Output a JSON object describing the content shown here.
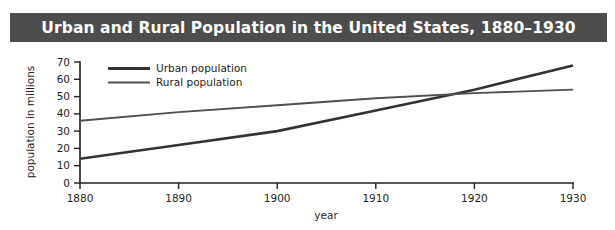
{
  "title": {
    "text": "Urban and Rural Population in the United States, 1880–1930",
    "background_color": "#4d4d4d",
    "text_color": "#ffffff"
  },
  "chart_data": {
    "type": "line",
    "title": "Urban and Rural Population in the United States, 1880–1930",
    "xlabel": "year",
    "ylabel": "population in millions",
    "x": [
      1880,
      1890,
      1900,
      1910,
      1920,
      1930
    ],
    "xlim": [
      1880,
      1930
    ],
    "ylim": [
      0,
      70
    ],
    "xticks": [
      1880,
      1890,
      1900,
      1910,
      1920,
      1930
    ],
    "xtick_labels": [
      "1880",
      "1890",
      "1900",
      "1910",
      "1920",
      "1930"
    ],
    "yticks": [
      0,
      10,
      20,
      30,
      40,
      50,
      60,
      70
    ],
    "ytick_labels": [
      "0",
      "10",
      "20",
      "30",
      "40",
      "50",
      "60",
      "70"
    ],
    "grid": false,
    "legend_position": "upper-left-inside",
    "series": [
      {
        "name": "Urban population",
        "color": "#333333",
        "line_width": 2.6,
        "values": [
          14,
          22,
          30,
          42,
          54,
          68
        ]
      },
      {
        "name": "Rural population",
        "color": "#4f4f4f",
        "line_width": 1.9,
        "values": [
          36,
          41,
          45,
          49,
          52,
          54
        ]
      }
    ],
    "annotations": [
      {
        "text": "lines cross near 1918 at about 51 million"
      }
    ]
  },
  "legend": {
    "items": [
      {
        "label": "Urban population",
        "swatch_color": "#333333"
      },
      {
        "label": "Rural population",
        "swatch_color": "#4f4f4f"
      }
    ]
  },
  "axes": {
    "x_title": "year",
    "y_title": "population in millions"
  }
}
